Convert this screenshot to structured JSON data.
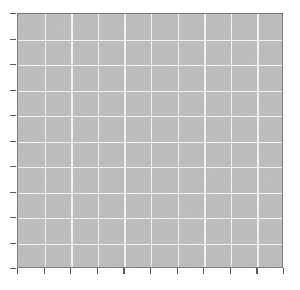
{
  "figure": {
    "width": 300,
    "height": 290,
    "background_color": "#ffffff",
    "title": "",
    "has_title": false,
    "has_legend": false,
    "has_tick_labels": false,
    "has_axis_labels": false
  },
  "panel": {
    "left": 17,
    "top": 13,
    "width": 266,
    "height": 255,
    "fill_color": "#b9b9b9",
    "border_color": "#7d7d7d",
    "border_width": 1,
    "texture": "noise"
  },
  "grid": {
    "color": "#f2f2f2",
    "line_width": 1.4,
    "columns": 10,
    "rows": 10,
    "vertical_line_count": 9,
    "horizontal_line_count": 9,
    "visible": true
  },
  "axes": {
    "tick_color": "#5a5a5a",
    "tick_length": 6,
    "bottom": {
      "name": "x-axis",
      "tick_count": 11,
      "tick_labels": [],
      "label": "",
      "ticks_visible": true
    },
    "left": {
      "name": "y-axis",
      "tick_count": 11,
      "tick_labels": [],
      "label": "",
      "ticks_visible": true
    },
    "top": {
      "name": "top-spine",
      "ticks_visible": false
    },
    "right": {
      "name": "right-spine",
      "ticks_visible": false
    }
  },
  "chart_data": {
    "type": "heatmap",
    "title": "",
    "subtitle": "",
    "xlabel": "",
    "ylabel": "",
    "x": [
      0,
      1,
      2,
      3,
      4,
      5,
      6,
      7,
      8,
      9
    ],
    "y": [
      0,
      1,
      2,
      3,
      4,
      5,
      6,
      7,
      8,
      9
    ],
    "categories": [],
    "values": [],
    "series": [],
    "xlim": [
      0,
      10
    ],
    "ylim": [
      0,
      10
    ],
    "xtick_labels": [],
    "ytick_labels": [],
    "grid": true,
    "legend": false,
    "legend_position": "none",
    "annotations": [],
    "note": "Empty 10x10 grid panel with uniform flat gray fill; no data series, labels, or legend are rendered."
  }
}
